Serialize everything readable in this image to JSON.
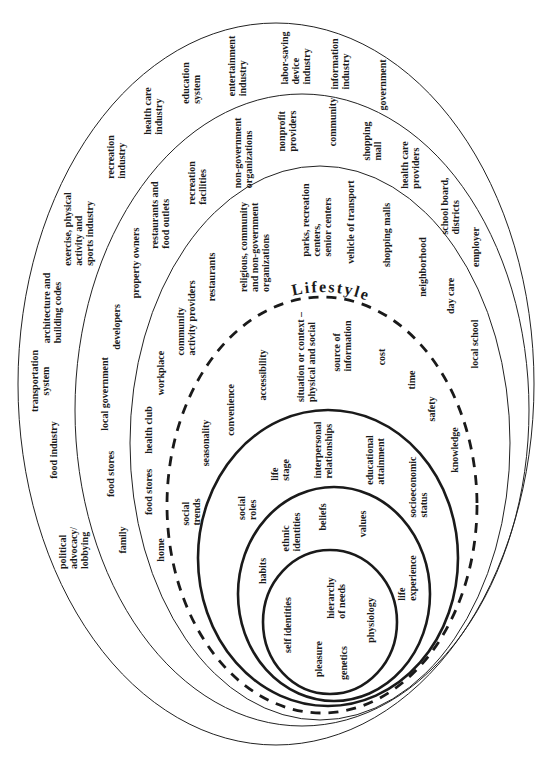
{
  "diagram": {
    "lifestyle_title": "Lifestyle",
    "colors": {
      "background": "#ffffff",
      "lines": "#222222",
      "text": "#1a1a1a"
    },
    "bands": [
      {
        "labels": [
          "political\nadvocacy/\nlobbying",
          "food industry",
          "transportation\nsystem",
          "architecture and\nbuilding codes",
          "exercise, physical\nactivity and\nsports industry",
          "recreation\nindustry",
          "health care\nindustry",
          "education\nsystem",
          "entertainment\nindustry",
          "labor-saving\ndevice\nindustry",
          "information\nindustry",
          "government"
        ]
      },
      {
        "labels": [
          "family",
          "food stores",
          "local government",
          "developers",
          "property owners",
          "restaurants and\nfood outlets",
          "recreation\nfacilities",
          "non-government\norganizations",
          "nonprofit\nproviders",
          "community",
          "shopping\nmall",
          "health care\nproviders",
          "school board,\ndistricts",
          "employer"
        ]
      },
      {
        "labels": [
          "home",
          "food stores",
          "health club",
          "workplace",
          "community\nactivity providers",
          "restaurants",
          "religious, community\nand non-government\norganizations",
          "parks, recreation\ncenters,\nsenior centers",
          "vehicle of transport",
          "shopping malls",
          "neighborhood",
          "day care",
          "local school"
        ]
      },
      {
        "labels": [
          "social\ntrends",
          "seasonality",
          "convenience",
          "accessibility",
          "situation or context –\nphysical and social",
          "source of\ninformation",
          "cost",
          "time",
          "safety",
          "knowledge"
        ]
      },
      {
        "labels": [
          "social\nroles",
          "life\nstage",
          "interpersonal\nrelationships",
          "educational\nattainment",
          "socioeconomic\nstatus"
        ]
      },
      {
        "labels": [
          "habits",
          "ethnic\nidentities",
          "beliefs",
          "values",
          "life\nexperience"
        ]
      },
      {
        "labels": [
          "self identities",
          "pleasure",
          "genetics",
          "hierarchy\nof needs",
          "physiology"
        ]
      }
    ]
  }
}
